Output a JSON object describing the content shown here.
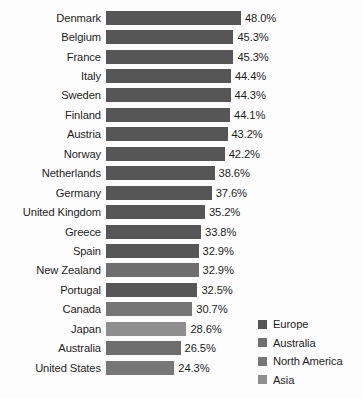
{
  "chart_data": {
    "type": "bar",
    "orientation": "horizontal",
    "title": "",
    "subtitle": "",
    "xlabel": "",
    "ylabel": "",
    "grid": false,
    "xlim": [
      0,
      48.0
    ],
    "value_suffix": "%",
    "legend_position": "bottom-right",
    "categories": [
      "Denmark",
      "Belgium",
      "France",
      "Italy",
      "Sweden",
      "Finland",
      "Austria",
      "Norway",
      "Netherlands",
      "Germany",
      "United Kingdom",
      "Greece",
      "Spain",
      "New Zealand",
      "Portugal",
      "Canada",
      "Japan",
      "Australia",
      "United States"
    ],
    "values": [
      48.0,
      45.3,
      45.3,
      44.4,
      44.3,
      44.1,
      43.2,
      42.2,
      38.6,
      37.6,
      35.2,
      33.8,
      32.9,
      32.9,
      32.5,
      30.7,
      28.6,
      26.5,
      24.3
    ],
    "value_labels": [
      "48.0%",
      "45.3%",
      "45.3%",
      "44.4%",
      "44.3%",
      "44.1%",
      "43.2%",
      "42.2%",
      "38.6%",
      "37.6%",
      "35.2%",
      "33.8%",
      "32.9%",
      "32.9%",
      "32.5%",
      "30.7%",
      "28.6%",
      "26.5%",
      "24.3%"
    ],
    "groups": [
      "Europe",
      "Europe",
      "Europe",
      "Europe",
      "Europe",
      "Europe",
      "Europe",
      "Europe",
      "Europe",
      "Europe",
      "Europe",
      "Europe",
      "Europe",
      "Australia",
      "Europe",
      "North America",
      "Asia",
      "Australia",
      "North America"
    ],
    "legend": [
      {
        "label": "Europe",
        "key": "europe",
        "color": "#565656"
      },
      {
        "label": "Australia",
        "key": "australia",
        "color": "#6e6e6e"
      },
      {
        "label": "North America",
        "key": "north-america",
        "color": "#767676"
      },
      {
        "label": "Asia",
        "key": "asia",
        "color": "#8e8e8e"
      }
    ]
  }
}
